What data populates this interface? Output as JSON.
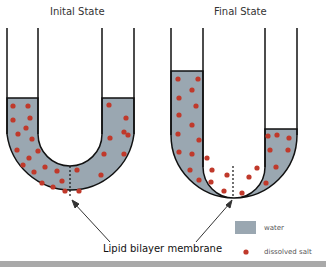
{
  "titles": {
    "left": "Inital State",
    "right": "Final State"
  },
  "membrane_label": "Lipid bilayer membrane",
  "legend": {
    "water": {
      "label": "water",
      "color": "#9aa7b1"
    },
    "salt": {
      "label": "dissolved salt",
      "color": "#c0392b"
    }
  },
  "colors": {
    "water": "#9aa7b1",
    "salt": "#c0392b",
    "outline": "#111111",
    "bottom_bar": "#a9a9a9"
  }
}
